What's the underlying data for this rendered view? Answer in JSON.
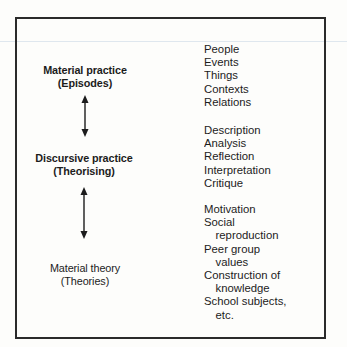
{
  "diagram": {
    "levels": [
      {
        "title": "Material practice",
        "subtitle": "(Episodes)",
        "items": [
          {
            "text": "People",
            "indent": false
          },
          {
            "text": "Events",
            "indent": false
          },
          {
            "text": "Things",
            "indent": false
          },
          {
            "text": "Contexts",
            "indent": false
          },
          {
            "text": "Relations",
            "indent": false
          }
        ]
      },
      {
        "title": "Discursive practice",
        "subtitle": "(Theorising)",
        "items": [
          {
            "text": "Description",
            "indent": false
          },
          {
            "text": "Analysis",
            "indent": false
          },
          {
            "text": "Reflection",
            "indent": false
          },
          {
            "text": "Interpretation",
            "indent": false
          },
          {
            "text": "Critique",
            "indent": false
          }
        ]
      },
      {
        "title": "Material theory",
        "subtitle": "(Theories)",
        "items": [
          {
            "text": "Motivation",
            "indent": false
          },
          {
            "text": "Social",
            "indent": false
          },
          {
            "text": "reproduction",
            "indent": true
          },
          {
            "text": "Peer group",
            "indent": false
          },
          {
            "text": "values",
            "indent": true
          },
          {
            "text": "Construction of",
            "indent": false
          },
          {
            "text": "knowledge",
            "indent": true
          },
          {
            "text": "School subjects,",
            "indent": false
          },
          {
            "text": "etc.",
            "indent": true
          }
        ]
      }
    ],
    "connectors": [
      {
        "from": "Material practice",
        "to": "Discursive practice",
        "icon": "double-arrow-vertical-icon"
      },
      {
        "from": "Discursive practice",
        "to": "Material theory",
        "icon": "double-arrow-vertical-icon"
      }
    ],
    "colors": {
      "ink": "#1c1c1c",
      "frame": "#2a2a2a",
      "paper": "#fdfdfb"
    }
  }
}
